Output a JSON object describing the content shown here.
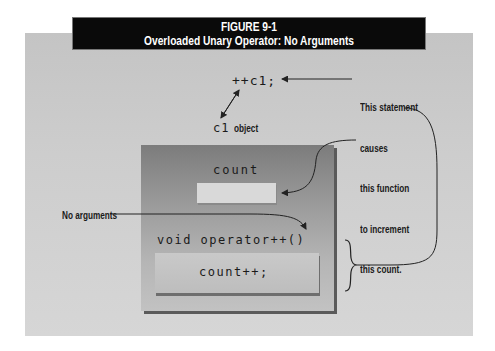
{
  "figure": {
    "number": "FIGURE 9-1",
    "title": "Overloaded Unary Operator: No Arguments"
  },
  "code": {
    "statement": "++c1;",
    "member_variable": "count",
    "function_signature": "void operator++()",
    "function_body": "count++;"
  },
  "labels": {
    "object_name": "c1",
    "object_suffix": "object",
    "no_arguments": "No arguments",
    "annotation_lines": [
      "This statement",
      "causes",
      "this function",
      "to increment",
      "this count."
    ]
  },
  "colors": {
    "title_bg": "#0a0a0a",
    "title_text": "#ffffff",
    "panel_bg": "#cdcdcd",
    "outer_box_top": "#7c7c7c",
    "outer_box_bottom": "#c2c2c2",
    "field_bg": "#d9d9d9"
  }
}
